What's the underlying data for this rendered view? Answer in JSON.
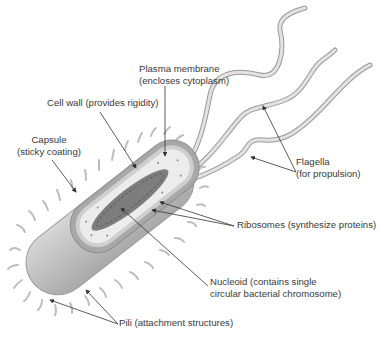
{
  "diagram": {
    "labels": [
      {
        "id": "plasma_membrane",
        "line1": "Plasma membrane",
        "line2": "(encloses cytoplasm)"
      },
      {
        "id": "cell_wall",
        "line1": "Cell wall (provides rigidity)"
      },
      {
        "id": "capsule",
        "line1": "Capsule",
        "line2": "(sticky coating)"
      },
      {
        "id": "flagella",
        "line1": "Flagella",
        "line2": "(for propulsion)"
      },
      {
        "id": "ribosomes",
        "line1": "Ribosomes (synthesize proteins)"
      },
      {
        "id": "nucleoid",
        "line1": "Nucleoid (contains single",
        "line2": "circular bacterial chromosome)"
      },
      {
        "id": "pili",
        "line1": "Pili (attachment structures)"
      }
    ],
    "colors": {
      "capsule_fill": "#c9c9c9",
      "cell_wall": "#9e9e9e",
      "cytoplasm": "#e8e8e8",
      "nucleoid": "#7a7a7a",
      "flagella": "#d2d2d2",
      "leader_line": "#333333",
      "text": "#3a3a3a"
    }
  }
}
